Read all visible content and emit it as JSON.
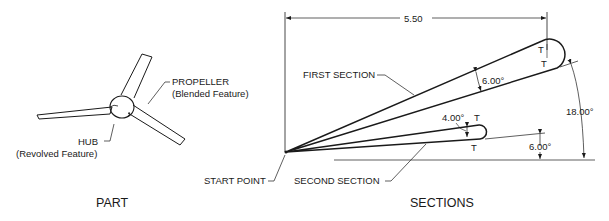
{
  "part": {
    "title": "PART",
    "propeller_label": "PROPELLER",
    "propeller_sub": "(Blended Feature)",
    "hub_label": "HUB",
    "hub_sub": "(Revolved Feature)"
  },
  "sections": {
    "title": "SECTIONS",
    "first_section_label": "FIRST SECTION",
    "second_section_label": "SECOND SECTION",
    "start_point_label": "START POINT",
    "length_dim": "5.50",
    "first_section_angle": "6.00°",
    "first_section_offset_angle": "18.00°",
    "second_section_angle": "4.00°",
    "second_section_offset_angle": "6.00°",
    "tangent_marks": [
      "T",
      "T",
      "T",
      "T"
    ]
  },
  "colors": {
    "line": "#1a1a1a",
    "background": "#ffffff"
  }
}
